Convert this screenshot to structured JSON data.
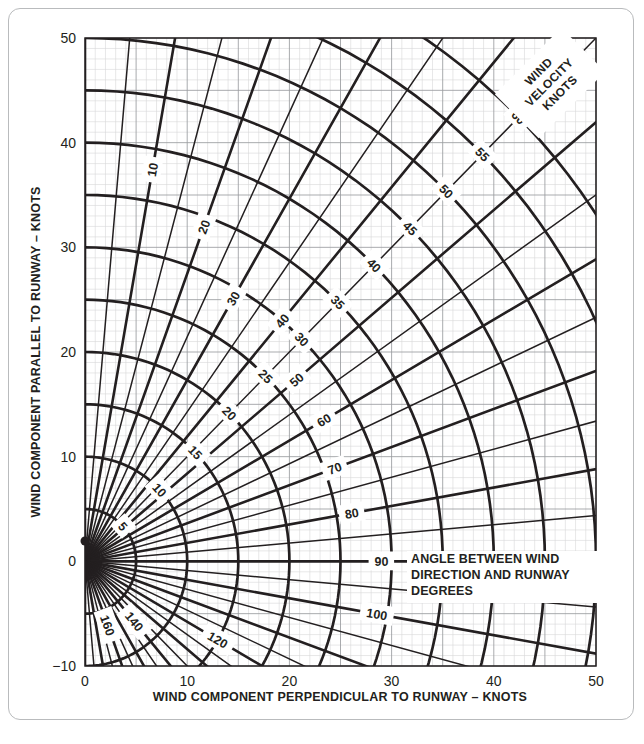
{
  "document": {
    "title": "Crosswind Component Chart",
    "card_border_color": "#b9bbbd",
    "ink_color": "#231f20",
    "grid_minor_color": "#d6d7d9",
    "grid_major_color": "#8e9093"
  },
  "axes": {
    "x": {
      "title": "WIND COMPONENT PERPENDICULAR TO RUNWAY – KNOTS",
      "min": 0,
      "max": 50,
      "tick_labels": [
        "0",
        "10",
        "20",
        "30",
        "40",
        "50"
      ],
      "tick_values": [
        0,
        10,
        20,
        30,
        40,
        50
      ],
      "minor_step": 1,
      "major_step": 5
    },
    "y": {
      "title": "WIND COMPONENT PARALLEL TO RUNWAY – KNOTS",
      "min": -10,
      "max": 50,
      "tick_labels": [
        "−10",
        "0",
        "10",
        "20",
        "30",
        "40",
        "50"
      ],
      "tick_values": [
        -10,
        0,
        10,
        20,
        30,
        40,
        50
      ],
      "minor_step": 1,
      "major_step": 5
    }
  },
  "legend": {
    "velocity_caption_lines": [
      "WIND",
      "VELOCITY",
      "KNOTS"
    ],
    "angle_caption_lines": [
      "ANGLE BETWEEN WIND",
      "DIRECTION AND RUNWAY",
      "DEGREES"
    ]
  },
  "chart_data": {
    "type": "line",
    "xlabel": "WIND COMPONENT PERPENDICULAR TO RUNWAY – KNOTS",
    "ylabel": "WIND COMPONENT PARALLEL TO RUNWAY – KNOTS",
    "xlim": [
      0,
      50
    ],
    "ylim": [
      -10,
      50
    ],
    "grid": true,
    "legend_position": "top-right",
    "polar_origin": [
      0,
      0
    ],
    "velocity_arcs": {
      "name": "WIND VELOCITY KNOTS",
      "unit": "knots",
      "labeled_values": [
        5,
        10,
        15,
        20,
        25,
        30,
        35,
        40,
        45,
        50,
        55,
        60
      ],
      "unlabeled_values": [],
      "label_angle_deg": 45
    },
    "angle_rays": {
      "name": "ANGLE BETWEEN WIND DIRECTION AND RUNWAY DEGREES",
      "unit": "degrees",
      "step": 10,
      "labeled_values": [
        10,
        20,
        30,
        40,
        50,
        60,
        70,
        80,
        90,
        100,
        120,
        140,
        160
      ],
      "all_values": [
        0,
        10,
        20,
        30,
        40,
        50,
        60,
        70,
        80,
        90,
        100,
        110,
        120,
        130,
        140,
        150,
        160,
        170,
        180
      ],
      "minor_step": 5
    }
  },
  "velocity_label_text": {
    "v5": "5",
    "v10": "10",
    "v15": "15",
    "v20": "20",
    "v25": "25",
    "v30": "30",
    "v35": "35",
    "v40": "40",
    "v45": "45",
    "v50": "50",
    "v55": "55",
    "v60": "60"
  },
  "angle_label_text": {
    "a10": "10",
    "a20": "20",
    "a30": "30",
    "a40": "40",
    "a50": "50",
    "a60": "60",
    "a70": "70",
    "a80": "80",
    "a90": "90",
    "a100": "100",
    "a120": "120",
    "a140": "140",
    "a160": "160"
  }
}
